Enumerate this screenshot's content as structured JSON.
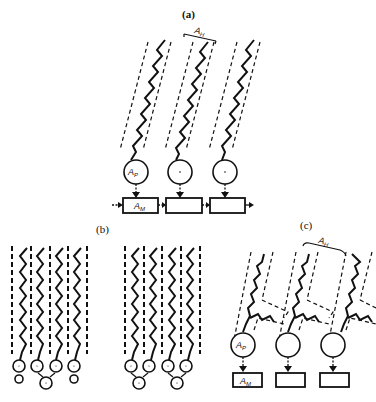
{
  "panels": {
    "a": {
      "label": "(a)",
      "width_label": "A",
      "width_sub": "H",
      "head_label": "A",
      "head_sub": "P",
      "box_label": "A",
      "box_sub": "M",
      "molecules": 3,
      "description": "Tilted single-chain amphiphiles with headgroups linked to connected matrix boxes"
    },
    "b": {
      "label": "(b)",
      "groups": 2,
      "chains_per_group": 4,
      "description": "Vertical chains in dashed columns with headgroups and paired counterions"
    },
    "c": {
      "label": "(c)",
      "width_label": "A",
      "width_sub": "H",
      "head_label": "A",
      "head_sub": "P",
      "box_label": "A",
      "box_sub": "M",
      "molecules": 3,
      "description": "Tilted branched (double-chain) amphiphiles with headgroups over separate matrix boxes"
    }
  }
}
